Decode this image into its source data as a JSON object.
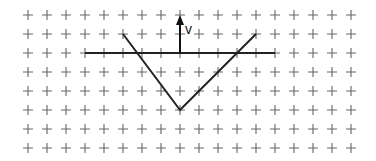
{
  "diagram": {
    "grid": {
      "cols": 18,
      "rows": 8,
      "x0": 28,
      "y0": 15,
      "step": 19,
      "marker": "+",
      "color": "#666666"
    },
    "horizontal_line": {
      "from": [
        3,
        2
      ],
      "to": [
        13,
        2
      ],
      "color": "#222222"
    },
    "v_shape": {
      "points": [
        [
          5,
          1
        ],
        [
          8,
          5
        ],
        [
          12,
          1
        ]
      ],
      "color": "#222222"
    },
    "arrow": {
      "from": [
        8,
        2
      ],
      "to": [
        8,
        0
      ],
      "label": "v",
      "color": "#111111"
    }
  }
}
